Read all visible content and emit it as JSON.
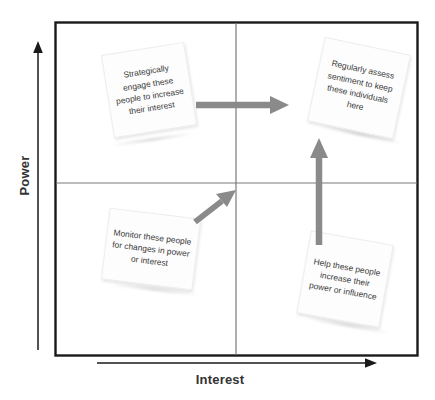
{
  "diagram": {
    "axes": {
      "y_label": "Power",
      "x_label": "Interest"
    },
    "colors": {
      "frame": "#1a1a1a",
      "divider": "#7a7a7a",
      "arrow": "#808080",
      "note_background": "#fdfdfd",
      "note_text": "#3a3a3a",
      "axis_text": "#333333"
    },
    "quadrant_notes": [
      {
        "id": "strategically-engage",
        "quadrant": "high-power-low-interest",
        "text": "Strategically engage these people to increase their interest"
      },
      {
        "id": "regularly-assess",
        "quadrant": "high-power-high-interest",
        "text": "Regularly assess sentiment to keep these individuals here"
      },
      {
        "id": "monitor-these-people",
        "quadrant": "low-power-low-interest",
        "text": "Monitor these people for changes in power or interest"
      },
      {
        "id": "help-these-people",
        "quadrant": "low-power-high-interest",
        "text": "Help these people increase their power or influence"
      }
    ],
    "flow_arrows": [
      {
        "id": "arrow-left-to-right",
        "direction": "right",
        "from": "strategically-engage",
        "to": "regularly-assess"
      },
      {
        "id": "arrow-bottom-to-top",
        "direction": "up",
        "from": "help-these-people",
        "to": "regularly-assess"
      },
      {
        "id": "arrow-diagonal-up-right",
        "direction": "up-right",
        "from": "monitor-these-people",
        "to": "upper-right-quadrant"
      }
    ]
  }
}
